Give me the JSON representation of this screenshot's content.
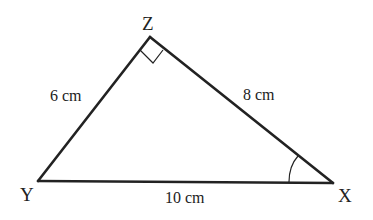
{
  "diagram": {
    "type": "right-triangle",
    "vertices": {
      "Z": {
        "label": "Z",
        "x": 150,
        "y": 37
      },
      "Y": {
        "label": "Y",
        "x": 38,
        "y": 181
      },
      "X": {
        "label": "X",
        "x": 333,
        "y": 183
      }
    },
    "sides": {
      "YZ": {
        "label": "6 cm"
      },
      "ZX": {
        "label": "8 cm"
      },
      "YX": {
        "label": "10 cm"
      }
    },
    "markers": {
      "right_angle_at": "Z",
      "angle_arc_at": "X"
    },
    "colors": {
      "stroke": "#222222",
      "background": "#ffffff"
    }
  }
}
